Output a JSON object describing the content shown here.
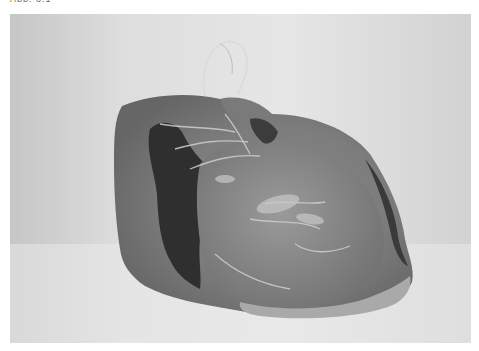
{
  "caption": {
    "text": "Abb. 3.1"
  },
  "photo": {
    "subject": "plastic-bag-with-wire-handle",
    "grayscale": true,
    "colors": {
      "background_light": "#e6e6e6",
      "background_shadow": "#c8c8c8",
      "bag_mid": "#8a8a8a",
      "bag_dark": "#5a5a5a",
      "bag_darkest": "#2e2e2e",
      "bag_highlight": "#b5b5b5",
      "wire": "#d8d8d8"
    }
  }
}
